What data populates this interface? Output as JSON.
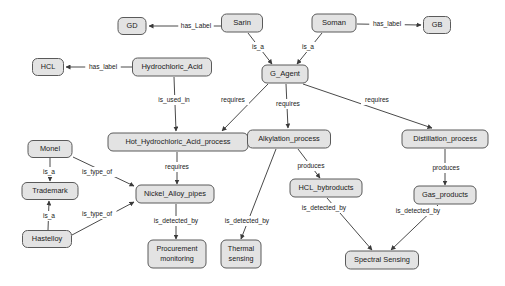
{
  "diagram": {
    "background_color": "#ffffff",
    "node_fill": "#e3e3e3",
    "node_stroke": "#5a5a5a",
    "edge_color": "#4a4a4a",
    "text_color": "#1a1a1a",
    "nodes": [
      {
        "id": "gd",
        "label": "GD",
        "x": 132,
        "y": 26,
        "w": 28,
        "h": 17,
        "font": 7.4
      },
      {
        "id": "sarin",
        "label": "Sarin",
        "x": 242,
        "y": 23,
        "w": 41,
        "h": 18,
        "font": 7.6
      },
      {
        "id": "soman",
        "label": "Soman",
        "x": 334,
        "y": 23,
        "w": 44,
        "h": 18,
        "font": 7.6
      },
      {
        "id": "gb",
        "label": "GB",
        "x": 437,
        "y": 25,
        "w": 27,
        "h": 17,
        "font": 7.4
      },
      {
        "id": "hcl",
        "label": "HCL",
        "x": 48,
        "y": 67,
        "w": 31,
        "h": 17,
        "font": 7.2
      },
      {
        "id": "hydrochloric",
        "label": "Hydrochloric_Acid",
        "x": 172,
        "y": 67,
        "w": 79,
        "h": 18,
        "font": 7.6
      },
      {
        "id": "gagent",
        "label": "G_Agent",
        "x": 285,
        "y": 74,
        "w": 46,
        "h": 18,
        "font": 7.6
      },
      {
        "id": "hotprocess",
        "label": "Hot_Hydrochloric_Acid_process",
        "x": 178,
        "y": 142,
        "w": 140,
        "h": 18,
        "font": 7.4
      },
      {
        "id": "alkylation",
        "label": "Alkylation_process",
        "x": 289,
        "y": 139,
        "w": 83,
        "h": 18,
        "font": 7.4
      },
      {
        "id": "distillation",
        "label": "Distillation_process",
        "x": 445,
        "y": 139,
        "w": 86,
        "h": 18,
        "font": 7.4
      },
      {
        "id": "monel",
        "label": "Monel",
        "x": 50,
        "y": 149,
        "w": 44,
        "h": 17,
        "font": 7.4
      },
      {
        "id": "trademark",
        "label": "Trademark",
        "x": 50,
        "y": 191,
        "w": 56,
        "h": 17,
        "font": 7.4
      },
      {
        "id": "hastelloy",
        "label": "Hastelloy",
        "x": 47,
        "y": 239,
        "w": 49,
        "h": 17,
        "font": 7.4
      },
      {
        "id": "nickel",
        "label": "Nickel_Alloy_pipes",
        "x": 175,
        "y": 194,
        "w": 78,
        "h": 18,
        "font": 7.4
      },
      {
        "id": "hclby",
        "label": "HCL_bybroducts",
        "x": 326,
        "y": 188,
        "w": 72,
        "h": 18,
        "font": 7.4
      },
      {
        "id": "gasprod",
        "label": "Gas_products",
        "x": 445,
        "y": 195,
        "w": 62,
        "h": 18,
        "font": 7.4
      },
      {
        "id": "procurement",
        "label": "Procurement\nmonitoring",
        "x": 177,
        "y": 254,
        "w": 58,
        "h": 28,
        "font": 7.2
      },
      {
        "id": "thermal",
        "label": "Thermal\nsensing",
        "x": 241,
        "y": 254,
        "w": 40,
        "h": 28,
        "font": 7.2
      },
      {
        "id": "spectral",
        "label": "Spectral Sensing",
        "x": 382,
        "y": 260,
        "w": 73,
        "h": 18,
        "font": 7.4
      }
    ],
    "edges": [
      {
        "id": "e1",
        "from": "sarin",
        "to": "gd",
        "label": "has_Label",
        "lx": 196,
        "ly": 26,
        "x1": 221,
        "y1": 26,
        "x2": 149,
        "y2": 26
      },
      {
        "id": "e2",
        "from": "soman",
        "to": "gb",
        "label": "has_label",
        "lx": 387,
        "ly": 24,
        "x1": 357,
        "y1": 24,
        "x2": 421,
        "y2": 25
      },
      {
        "id": "e3",
        "from": "sarin",
        "to": "gagent",
        "label": "is_a",
        "lx": 258,
        "ly": 47,
        "x1": 248,
        "y1": 33,
        "x2": 272,
        "y2": 64
      },
      {
        "id": "e4",
        "from": "soman",
        "to": "gagent",
        "label": "is_a",
        "lx": 308,
        "ly": 47,
        "x1": 322,
        "y1": 33,
        "x2": 297,
        "y2": 64
      },
      {
        "id": "e5",
        "from": "hydrochloric",
        "to": "hcl",
        "label": "has_label",
        "lx": 103,
        "ly": 67,
        "x1": 132,
        "y1": 67,
        "x2": 66,
        "y2": 67
      },
      {
        "id": "e6",
        "from": "hydrochloric",
        "to": "hotprocess",
        "label": "is_used_in",
        "lx": 174,
        "ly": 100,
        "x1": 174,
        "y1": 77,
        "x2": 176,
        "y2": 131
      },
      {
        "id": "e7",
        "from": "gagent",
        "to": "hotprocess",
        "label": "requires",
        "lx": 233,
        "ly": 100,
        "x1": 268,
        "y1": 84,
        "x2": 222,
        "y2": 131
      },
      {
        "id": "e8",
        "from": "gagent",
        "to": "alkylation",
        "label": "requires",
        "lx": 288,
        "ly": 104,
        "x1": 286,
        "y1": 84,
        "x2": 288,
        "y2": 128
      },
      {
        "id": "e9",
        "from": "gagent",
        "to": "distillation",
        "label": "requires",
        "lx": 377,
        "ly": 100,
        "x1": 303,
        "y1": 84,
        "x2": 432,
        "y2": 128
      },
      {
        "id": "e10",
        "from": "monel",
        "to": "trademark",
        "label": "is_a",
        "lx": 49,
        "ly": 172,
        "x1": 50,
        "y1": 158,
        "x2": 50,
        "y2": 181
      },
      {
        "id": "e11",
        "from": "hastelloy",
        "to": "trademark",
        "label": "is_a",
        "lx": 49,
        "ly": 216,
        "x1": 48,
        "y1": 230,
        "x2": 49,
        "y2": 201
      },
      {
        "id": "e12",
        "from": "monel",
        "to": "nickel",
        "label": "is_type_of",
        "lx": 97,
        "ly": 172,
        "x1": 73,
        "y1": 157,
        "x2": 134,
        "y2": 186
      },
      {
        "id": "e13",
        "from": "hastelloy",
        "to": "nickel",
        "label": "is_type_of",
        "lx": 97,
        "ly": 214,
        "x1": 72,
        "y1": 235,
        "x2": 134,
        "y2": 202
      },
      {
        "id": "e14",
        "from": "hotprocess",
        "to": "nickel",
        "label": "requires",
        "lx": 177,
        "ly": 167,
        "x1": 177,
        "y1": 152,
        "x2": 177,
        "y2": 184
      },
      {
        "id": "e15",
        "from": "nickel",
        "to": "procurement",
        "label": "is_detected_by",
        "lx": 176,
        "ly": 221,
        "x1": 176,
        "y1": 204,
        "x2": 176,
        "y2": 239
      },
      {
        "id": "e16",
        "from": "alkylation",
        "to": "thermal",
        "label": "is_detected_by",
        "lx": 247,
        "ly": 221,
        "x1": 276,
        "y1": 149,
        "x2": 241,
        "y2": 239
      },
      {
        "id": "e17",
        "from": "alkylation",
        "to": "hclby",
        "label": "produces",
        "lx": 311,
        "ly": 166,
        "x1": 298,
        "y1": 149,
        "x2": 320,
        "y2": 178
      },
      {
        "id": "e18",
        "from": "hclby",
        "to": "spectral",
        "label": "is_detected_by",
        "lx": 324,
        "ly": 208,
        "x1": 327,
        "y1": 198,
        "x2": 372,
        "y2": 250
      },
      {
        "id": "e19",
        "from": "distillation",
        "to": "gasprod",
        "label": "produces",
        "lx": 446,
        "ly": 168,
        "x1": 445,
        "y1": 149,
        "x2": 445,
        "y2": 185
      },
      {
        "id": "e20",
        "from": "gasprod",
        "to": "spectral",
        "label": "is_detected_by",
        "lx": 418,
        "ly": 211,
        "x1": 438,
        "y1": 205,
        "x2": 391,
        "y2": 250
      }
    ]
  }
}
